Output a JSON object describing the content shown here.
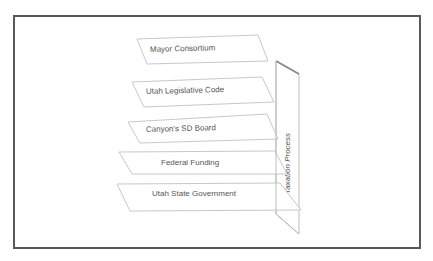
{
  "diagram": {
    "type": "layered-planes",
    "planes": [
      {
        "label": "Mayor Consortium"
      },
      {
        "label": "Utah Legislative Code"
      },
      {
        "label": "Canyon's SD Board"
      },
      {
        "label": "Federal Funding"
      },
      {
        "label": "Utah State Government"
      }
    ],
    "side_panel": {
      "label": "Taxation Process"
    },
    "colors": {
      "frame": "#5a5a5a",
      "plane_fill": "#ffffff",
      "plane_stroke": "#c8c8c8",
      "text": "#555555"
    }
  }
}
